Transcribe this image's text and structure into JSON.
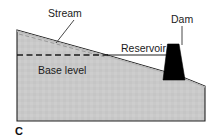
{
  "figure": {
    "panel_letter": "C",
    "labels": {
      "stream": "Stream",
      "reservoir": "Reservoir",
      "base_level": "Base level",
      "dam": "Dam"
    },
    "colors": {
      "land_fill": "#c9c9c9",
      "land_outline": "#222222",
      "dam_fill": "#000000",
      "water_line": "#222222",
      "base_level_dash": "#1a1a1a",
      "stream_profile_dash": "#9a9a9a",
      "leader_line": "#333333",
      "background": "#ffffff",
      "text": "#1b1b1b"
    },
    "geometry": {
      "land_polygon": "17,30 107,55 180,76 205,86 205,121 17,121",
      "water_surface_line": {
        "x1": 107,
        "y1": 55,
        "x2": 180,
        "y2": 55
      },
      "base_level_line": {
        "x1": 17,
        "y1": 55,
        "x2": 108,
        "y2": 55
      },
      "stream_profile_line": {
        "x1": 19,
        "y1": 34,
        "x2": 105,
        "y2": 57
      },
      "dam_polygon": "167.5,44 179,44 185,80 163,80",
      "dam_leader": {
        "x1": 182,
        "y1": 26,
        "x2": 182,
        "y2": 45
      },
      "stream_leader": {
        "x1": 74,
        "y1": 20,
        "x2": 56,
        "y2": 43
      }
    },
    "label_positions": {
      "stream": {
        "x": 48,
        "y": 17
      },
      "dam": {
        "x": 171,
        "y": 23
      },
      "reservoir": {
        "x": 121,
        "y": 52
      },
      "base_level": {
        "x": 38,
        "y": 74
      },
      "panel_letter": {
        "x": 15,
        "y": 135
      }
    }
  }
}
